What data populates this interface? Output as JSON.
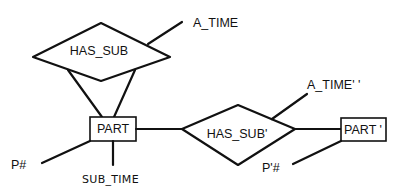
{
  "diagram": {
    "type": "entity-relationship",
    "relationships": [
      {
        "id": "has_sub",
        "label": "HAS_SUB",
        "shape": "diamond"
      },
      {
        "id": "has_sub_prime",
        "label": "HAS_SUB'",
        "shape": "diamond"
      }
    ],
    "entities": [
      {
        "id": "part",
        "label": "PART",
        "shape": "rectangle"
      },
      {
        "id": "part_prime",
        "label": "PART '",
        "shape": "rectangle"
      }
    ],
    "attributes": [
      {
        "id": "a_time",
        "label": "A_TIME",
        "attached_to": "has_sub"
      },
      {
        "id": "p_num",
        "label": "P#",
        "attached_to": "part"
      },
      {
        "id": "sub_time",
        "label": "SUB_TIME",
        "attached_to": "part"
      },
      {
        "id": "a_time_prime",
        "label": "A_TIME' '",
        "attached_to": "has_sub_prime"
      },
      {
        "id": "p_prime_num",
        "label": "P'#",
        "attached_to": "part_prime"
      }
    ],
    "connections": [
      {
        "from": "has_sub",
        "to": "part",
        "note": "two lines (recursive)"
      },
      {
        "from": "part",
        "to": "has_sub_prime"
      },
      {
        "from": "has_sub_prime",
        "to": "part_prime"
      }
    ]
  },
  "labels": {
    "has_sub": "HAS_SUB",
    "has_sub_prime": "HAS_SUB'",
    "part": "PART",
    "part_prime": "PART '",
    "a_time": "A_TIME",
    "a_time_prime": "A_TIME' '",
    "p_num": "P#",
    "p_prime_num": "P'#",
    "sub_time": "SUB_TIME"
  },
  "colors": {
    "stroke": "#111111",
    "background": "#ffffff"
  }
}
